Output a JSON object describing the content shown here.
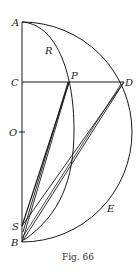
{
  "figure": {
    "caption": "Fig. 66",
    "labels": {
      "A": "A",
      "R": "R",
      "C": "C",
      "P": "P",
      "D": "D",
      "O": "O",
      "S": "S",
      "B": "B",
      "E": "E"
    },
    "points": {
      "A": [
        22,
        22
      ],
      "C": [
        22,
        82
      ],
      "P": [
        69,
        82
      ],
      "D": [
        124,
        82
      ],
      "O": [
        22,
        132
      ],
      "S": [
        22,
        226
      ],
      "B": [
        22,
        242
      ]
    },
    "colors": {
      "stroke": "#1a1a1a",
      "background": "#ffffff"
    }
  }
}
